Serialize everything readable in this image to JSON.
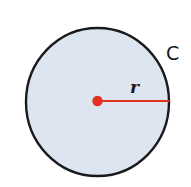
{
  "figure": {
    "name": "circle-with-radius-and-circumference",
    "background_color": "#ffffff",
    "width": 191,
    "height": 187
  },
  "circle": {
    "name": "circle-shape",
    "center_x": 97.5,
    "center_y": 102,
    "radius_x": 72.5,
    "radius_y": 75,
    "fill_color": "#dde6f0",
    "stroke_color": "#1a1a1c",
    "stroke_width": 2.4
  },
  "radius": {
    "name": "radius-segment",
    "label": "r",
    "color": "#e0301e",
    "stroke_width": 2.2,
    "from_x": 97.5,
    "from_y": 101,
    "to_x": 170,
    "to_y": 101,
    "label_x": 130,
    "label_y": 79
  },
  "center_point": {
    "name": "center-dot",
    "x": 97.5,
    "y": 101,
    "radius": 5.2,
    "color": "#e42f22"
  },
  "circumference": {
    "name": "circumference-label",
    "label": "C",
    "color": "#19191b",
    "label_x": 166,
    "label_y": 44
  },
  "labels": {
    "circumference_text": "C",
    "radius_text": "r"
  }
}
